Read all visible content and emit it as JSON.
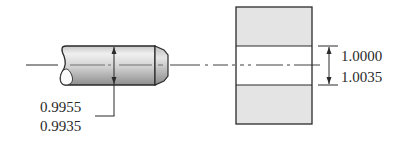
{
  "shaft": {
    "label": "Shaft (pin)",
    "diameter_upper": "0.9955",
    "diameter_lower": "0.9935"
  },
  "hole": {
    "label": "Bushing bore",
    "diameter_upper": "1.0000",
    "diameter_lower": "1.0035"
  },
  "colors": {
    "line": "#2a2a2a",
    "block_fill": "#e4e4e4",
    "shaft_light": "#f2f2f2",
    "shaft_dark": "#9a9a9a",
    "background": "#ffffff"
  }
}
